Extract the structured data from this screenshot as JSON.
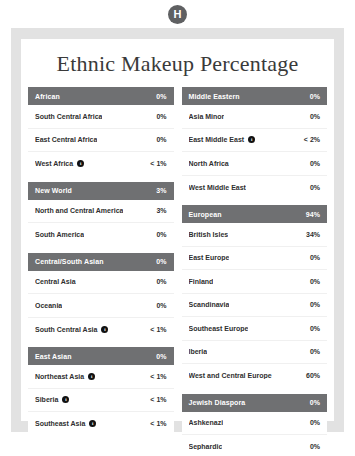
{
  "badge": {
    "letter": "H",
    "name": "h-avatar-badge"
  },
  "card": {
    "title": "Ethnic Makeup Percentage"
  },
  "icons": {
    "info": "i"
  },
  "chart_data": {
    "type": "table",
    "title": "Ethnic Makeup Percentage",
    "columns": [
      "Region",
      "Percentage"
    ],
    "groups": [
      {
        "column": "left",
        "name": "African",
        "value": "0%",
        "rows": [
          {
            "label": "South Central Africa",
            "value": "0%",
            "info": false
          },
          {
            "label": "East Central Africa",
            "value": "0%",
            "info": false
          },
          {
            "label": "West Africa",
            "value": "< 1%",
            "info": true
          }
        ]
      },
      {
        "column": "left",
        "name": "New World",
        "value": "3%",
        "rows": [
          {
            "label": "North and Central America",
            "value": "3%",
            "info": false
          },
          {
            "label": "South America",
            "value": "0%",
            "info": false
          }
        ]
      },
      {
        "column": "left",
        "name": "Central/South Asian",
        "value": "0%",
        "rows": [
          {
            "label": "Central Asia",
            "value": "0%",
            "info": false
          },
          {
            "label": "Oceania",
            "value": "0%",
            "info": false
          },
          {
            "label": "South Central Asia",
            "value": "< 1%",
            "info": true
          }
        ]
      },
      {
        "column": "left",
        "name": "East Asian",
        "value": "0%",
        "rows": [
          {
            "label": "Northeast Asia",
            "value": "< 1%",
            "info": true
          },
          {
            "label": "Siberia",
            "value": "< 1%",
            "info": true
          },
          {
            "label": "Southeast Asia",
            "value": "< 1%",
            "info": true
          }
        ]
      },
      {
        "column": "right",
        "name": "Middle Eastern",
        "value": "0%",
        "rows": [
          {
            "label": "Asia Minor",
            "value": "0%",
            "info": false
          },
          {
            "label": "East Middle East",
            "value": "< 2%",
            "info": true
          },
          {
            "label": "North Africa",
            "value": "0%",
            "info": false
          },
          {
            "label": "West Middle East",
            "value": "0%",
            "info": false
          }
        ]
      },
      {
        "column": "right",
        "name": "European",
        "value": "94%",
        "rows": [
          {
            "label": "British Isles",
            "value": "34%",
            "info": false
          },
          {
            "label": "East Europe",
            "value": "0%",
            "info": false
          },
          {
            "label": "Finland",
            "value": "0%",
            "info": false
          },
          {
            "label": "Scandinavia",
            "value": "0%",
            "info": false
          },
          {
            "label": "Southeast Europe",
            "value": "0%",
            "info": false
          },
          {
            "label": "Iberia",
            "value": "0%",
            "info": false
          },
          {
            "label": "West and Central Europe",
            "value": "60%",
            "info": false
          }
        ]
      },
      {
        "column": "right",
        "name": "Jewish Diaspora",
        "value": "0%",
        "rows": [
          {
            "label": "Ashkenazi",
            "value": "0%",
            "info": false
          },
          {
            "label": "Sephardic",
            "value": "0%",
            "info": false
          }
        ]
      }
    ]
  },
  "colors": {
    "header_bar": "#6f7072",
    "frame": "#e2e2e2",
    "card": "#ffffff",
    "text": "#2f2f2f",
    "badge": "#5f6062"
  }
}
